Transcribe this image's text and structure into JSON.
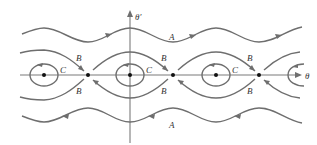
{
  "diagram": {
    "axes": {
      "x_label": "θ",
      "y_label": "θ′"
    },
    "regions": {
      "rotation_label": "A",
      "separatrix_label": "B",
      "libration_label": "C"
    },
    "equilibria": {
      "centers_x": [
        44,
        130,
        216
      ],
      "saddles_x": [
        88,
        173,
        259
      ]
    },
    "colors": {
      "curve": "#6e6e6e",
      "axis": "#7a7a7a",
      "point": "#111111",
      "text": "#333333"
    }
  }
}
